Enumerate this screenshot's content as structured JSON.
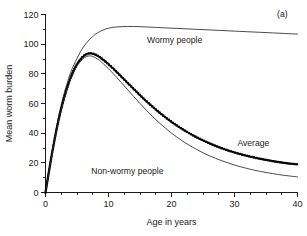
{
  "panel": {
    "label": "(a)"
  },
  "chart_data": {
    "type": "line",
    "title": "",
    "subtitle": "",
    "xlabel": "Age in years",
    "ylabel": "Mean worm burden",
    "xlim": [
      0,
      40
    ],
    "ylim": [
      0,
      120
    ],
    "x_major_ticks": [
      0,
      10,
      20,
      30,
      40
    ],
    "x_major_tick_labels": [
      "0",
      "10",
      "20",
      "30",
      "40"
    ],
    "x_minor_tick_step": 2.5,
    "y_major_ticks": [
      0,
      20,
      40,
      60,
      80,
      100,
      120
    ],
    "y_major_tick_labels": [
      "0",
      "20",
      "40",
      "60",
      "80",
      "100",
      "120"
    ],
    "y_minor_tick_step": 10,
    "grid": false,
    "legend_position": "inline-annotations",
    "annotations": [
      {
        "text": "(a)",
        "x": 37.6,
        "y": 118
      },
      {
        "text": "Wormy people",
        "x": 20.5,
        "y": 101
      },
      {
        "text": "Average",
        "x": 33.0,
        "y": 31.5
      },
      {
        "text": "Non-wormy people",
        "x": 13.0,
        "y": 12.5
      }
    ],
    "series": [
      {
        "name": "Wormy people",
        "style": "thin-line",
        "markers": false,
        "x": [
          0,
          0.5,
          1,
          1.5,
          2,
          2.5,
          3,
          3.5,
          4,
          4.5,
          5,
          5.5,
          6,
          6.5,
          7,
          7.5,
          8,
          9,
          10,
          11,
          12,
          13,
          14,
          15,
          16,
          17,
          18,
          20,
          22,
          24,
          26,
          28,
          30,
          32,
          34,
          36,
          38,
          40
        ],
        "y": [
          0,
          13.5,
          26.5,
          38.5,
          49.5,
          59.0,
          67.5,
          74.5,
          81.0,
          86.0,
          90.5,
          94.5,
          98.0,
          100.8,
          103.2,
          105.2,
          106.9,
          109.3,
          110.8,
          111.5,
          111.8,
          111.9,
          111.9,
          111.8,
          111.6,
          111.4,
          111.2,
          110.8,
          110.4,
          110.0,
          109.6,
          109.2,
          108.8,
          108.4,
          108.0,
          107.6,
          107.2,
          106.8
        ]
      },
      {
        "name": "Average",
        "style": "thick-dotted-line",
        "markers": true,
        "x": [
          0,
          0.5,
          1,
          1.5,
          2,
          2.5,
          3,
          3.5,
          4,
          4.5,
          5,
          5.5,
          6,
          6.5,
          7,
          7.5,
          8,
          8.5,
          9,
          10,
          11,
          12,
          13,
          14,
          15,
          16,
          17,
          18,
          19,
          20,
          21,
          22,
          23,
          24,
          25,
          26,
          27,
          28,
          29,
          30,
          31,
          32,
          33,
          34,
          35,
          36,
          37,
          38,
          39,
          40
        ],
        "y": [
          0,
          13.0,
          25.5,
          37.0,
          47.5,
          56.5,
          64.5,
          71.5,
          77.5,
          82.5,
          86.5,
          89.5,
          91.8,
          93.2,
          93.8,
          93.6,
          92.8,
          91.6,
          90.0,
          86.5,
          82.5,
          78.3,
          74.0,
          69.8,
          65.6,
          61.6,
          57.8,
          54.2,
          50.8,
          47.6,
          44.7,
          42.0,
          39.5,
          37.2,
          35.1,
          33.2,
          31.4,
          29.8,
          28.3,
          27.0,
          25.8,
          24.7,
          23.7,
          22.8,
          22.0,
          21.2,
          20.5,
          19.9,
          19.4,
          19.0
        ]
      },
      {
        "name": "Non-wormy people",
        "style": "thin-line",
        "markers": false,
        "x": [
          0,
          0.5,
          1,
          1.5,
          2,
          2.5,
          3,
          3.5,
          4,
          4.5,
          5,
          5.5,
          6,
          6.5,
          7,
          7.5,
          8,
          8.5,
          9,
          10,
          11,
          12,
          13,
          14,
          15,
          16,
          17,
          18,
          19,
          20,
          21,
          22,
          23,
          24,
          25,
          26,
          27,
          28,
          29,
          30,
          31,
          32,
          33,
          34,
          35,
          36,
          37,
          38,
          39,
          40
        ],
        "y": [
          0,
          12.8,
          25.2,
          36.5,
          46.8,
          55.8,
          63.7,
          70.5,
          76.4,
          81.3,
          85.2,
          88.1,
          90.3,
          91.6,
          92.1,
          91.7,
          90.7,
          89.3,
          87.5,
          83.5,
          79.0,
          74.3,
          69.5,
          64.7,
          60.0,
          55.5,
          51.2,
          47.2,
          43.5,
          40.0,
          36.9,
          34.0,
          31.4,
          29.0,
          26.8,
          24.8,
          23.0,
          21.4,
          19.9,
          18.5,
          17.3,
          16.2,
          15.2,
          14.3,
          13.5,
          12.8,
          12.1,
          11.5,
          11.0,
          10.5
        ]
      }
    ]
  }
}
